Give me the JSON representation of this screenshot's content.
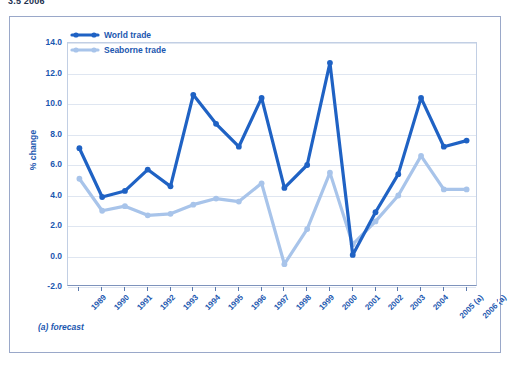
{
  "top_caption": "3.5 2006",
  "footnote": "(a) forecast",
  "colors": {
    "world_trade": "#1f62c4",
    "seaborne_trade": "#a8c4ea",
    "axis_text": "#1b57b0",
    "gridline": "#dfe6f1",
    "frame_border": "#9aa8c9"
  },
  "legend": {
    "position": "top-left-inside",
    "items": [
      {
        "label": "World trade",
        "color": "#1f62c4",
        "marker": "line-with-dots"
      },
      {
        "label": "Seaborne trade",
        "color": "#a8c4ea",
        "marker": "line-with-dots"
      }
    ]
  },
  "chart_data": {
    "type": "line",
    "title": "",
    "subtitle": "",
    "xlabel": "",
    "ylabel": "% change",
    "ylim": [
      -2.0,
      14.0
    ],
    "yticks": [
      "14.0",
      "12.0",
      "10.0",
      "8.0",
      "6.0",
      "4.0",
      "2.0",
      "0.0",
      "-2.0"
    ],
    "ytick_values": [
      14.0,
      12.0,
      10.0,
      8.0,
      6.0,
      4.0,
      2.0,
      0.0,
      -2.0
    ],
    "grid": true,
    "legend_position": "upper left",
    "categories": [
      "1989",
      "1990",
      "1991",
      "1992",
      "1993",
      "1994",
      "1995",
      "1996",
      "1997",
      "1998",
      "1999",
      "2000",
      "2001",
      "2002",
      "2003",
      "2004",
      "2005 (a)",
      "2006 (a)"
    ],
    "series": [
      {
        "name": "World trade",
        "color": "#1f62c4",
        "values": [
          7.1,
          3.9,
          4.3,
          5.7,
          4.6,
          10.6,
          8.7,
          7.2,
          10.4,
          4.5,
          6.0,
          12.7,
          0.1,
          2.9,
          5.4,
          10.4,
          7.2,
          7.6
        ]
      },
      {
        "name": "Seaborne trade",
        "color": "#a8c4ea",
        "values": [
          5.1,
          3.0,
          3.3,
          2.7,
          2.8,
          3.4,
          3.8,
          3.6,
          4.8,
          -0.5,
          1.8,
          5.5,
          0.8,
          2.3,
          4.0,
          6.6,
          4.4,
          4.4
        ]
      }
    ],
    "annotations": [
      "(a) forecast"
    ]
  }
}
